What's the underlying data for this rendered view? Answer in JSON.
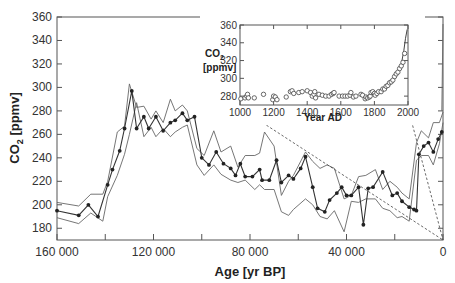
{
  "chart_data": [
    {
      "type": "line",
      "title": "",
      "xlabel": "Age [yr BP]",
      "ylabel_main": "CO",
      "ylabel_sub": "2",
      "ylabel_unit": " [ppmv]",
      "xlim": [
        160000,
        0
      ],
      "ylim": [
        170,
        360
      ],
      "x_ticks": [
        160000,
        120000,
        80000,
        40000,
        0
      ],
      "x_tick_labels": [
        "160 000",
        "120 000",
        "80 000",
        "40 000",
        "0"
      ],
      "x_minor_ticks": [
        140000,
        100000,
        60000,
        20000
      ],
      "y_ticks": [
        180,
        200,
        220,
        240,
        260,
        280,
        300,
        320,
        340,
        360
      ],
      "grid": false,
      "series": [
        {
          "name": "CO2 (ice core)",
          "style": "line with filled circle markers",
          "x": [
            160000,
            151000,
            147000,
            143000,
            139000,
            137000,
            134000,
            132000,
            129000,
            127000,
            124000,
            122000,
            119000,
            116000,
            113000,
            111000,
            108000,
            106000,
            103000,
            100000,
            97000,
            94000,
            91000,
            88000,
            86000,
            84000,
            82000,
            79000,
            76000,
            75000,
            72000,
            69000,
            67000,
            64000,
            62000,
            59000,
            57000,
            54000,
            52000,
            49000,
            47000,
            44000,
            42000,
            40000,
            38000,
            35000,
            33000,
            31000,
            29000,
            25000,
            21000,
            19000,
            17000,
            14000,
            12000,
            11000,
            10000,
            8000,
            6000,
            4000,
            2000,
            500
          ],
          "values": [
            195,
            191,
            200,
            190,
            217,
            230,
            246,
            265,
            297,
            265,
            275,
            265,
            275,
            263,
            270,
            272,
            278,
            272,
            275,
            240,
            234,
            245,
            235,
            231,
            225,
            235,
            224,
            224,
            230,
            221,
            221,
            238,
            219,
            225,
            222,
            231,
            241,
            215,
            197,
            194,
            204,
            210,
            215,
            208,
            208,
            215,
            183,
            214,
            215,
            228,
            208,
            210,
            203,
            198,
            196,
            195,
            243,
            250,
            253,
            245,
            256,
            262
          ]
        },
        {
          "name": "Upper uncertainty band",
          "style": "thin line",
          "x": [
            160000,
            151000,
            146000,
            141000,
            139000,
            135000,
            132000,
            130000,
            127000,
            124000,
            121000,
            119000,
            116000,
            113000,
            111000,
            108000,
            106000,
            102000,
            99000,
            95000,
            92000,
            88000,
            85000,
            82000,
            78000,
            76000,
            74000,
            70000,
            67000,
            64000,
            62000,
            57000,
            54000,
            51000,
            48000,
            45000,
            41000,
            38000,
            35000,
            32000,
            28000,
            25000,
            22000,
            19000,
            17000,
            14000,
            11000,
            9000,
            6000,
            4000,
            1500,
            0
          ],
          "values": [
            202,
            199,
            209,
            209,
            220,
            262,
            267,
            303,
            283,
            284,
            273,
            280,
            270,
            290,
            280,
            285,
            280,
            248,
            242,
            263,
            245,
            250,
            232,
            242,
            242,
            244,
            262,
            250,
            208,
            220,
            225,
            245,
            237,
            231,
            234,
            231,
            205,
            208,
            224,
            225,
            230,
            213,
            220,
            215,
            210,
            205,
            253,
            263,
            257,
            270,
            270,
            279
          ]
        },
        {
          "name": "Lower uncertainty band",
          "style": "thin line",
          "x": [
            160000,
            151000,
            146000,
            141000,
            139000,
            135000,
            132000,
            130000,
            127000,
            124000,
            121000,
            119000,
            116000,
            113000,
            111000,
            108000,
            106000,
            102000,
            99000,
            95000,
            92000,
            88000,
            85000,
            82000,
            78000,
            76000,
            74000,
            70000,
            67000,
            64000,
            62000,
            57000,
            54000,
            51000,
            48000,
            45000,
            41000,
            38000,
            35000,
            32000,
            28000,
            25000,
            22000,
            19000,
            17000,
            14000,
            11000,
            9000,
            6000,
            4000,
            1500,
            0
          ],
          "values": [
            189,
            184,
            193,
            186,
            207,
            225,
            243,
            260,
            287,
            258,
            266,
            258,
            265,
            258,
            262,
            266,
            268,
            234,
            225,
            234,
            226,
            221,
            219,
            221,
            213,
            217,
            213,
            213,
            194,
            191,
            196,
            205,
            200,
            190,
            188,
            195,
            177,
            203,
            202,
            205,
            205,
            197,
            195,
            189,
            190,
            186,
            238,
            242,
            242,
            234,
            252,
            270
          ]
        },
        {
          "name": "Industrial-era rise",
          "style": "thin line",
          "x": [
            500,
            0
          ],
          "values": [
            280,
            354
          ]
        }
      ],
      "annotations": [
        {
          "type": "dashed-connector",
          "from": "inset x=1000 (Year AD)",
          "to": "main x=0"
        },
        {
          "type": "dashed-connector",
          "from": "inset x=2000 (Year AD)",
          "to": "main x=0"
        }
      ]
    },
    {
      "type": "scatter",
      "title": "",
      "position": "inset upper right",
      "xlabel": "Year AD",
      "ylabel_main": "CO",
      "ylabel_sub": "2",
      "ylabel_unit": "[ppmv]",
      "xlim": [
        1000,
        2000
      ],
      "ylim": [
        270,
        360
      ],
      "x_ticks": [
        1000,
        1200,
        1400,
        1600,
        1800,
        2000
      ],
      "y_ticks": [
        280,
        300,
        320,
        340,
        360
      ],
      "grid": false,
      "series": [
        {
          "name": "Ice core CO2 (last millennium)",
          "style": "open circles",
          "x": [
            1005,
            1030,
            1040,
            1045,
            1050,
            1085,
            1140,
            1195,
            1200,
            1210,
            1220,
            1275,
            1300,
            1310,
            1320,
            1350,
            1370,
            1400,
            1420,
            1430,
            1440,
            1445,
            1450,
            1470,
            1490,
            1510,
            1530,
            1545,
            1555,
            1560,
            1590,
            1610,
            1625,
            1640,
            1655,
            1660,
            1675,
            1690,
            1720,
            1730,
            1745,
            1750,
            1760,
            1770,
            1775,
            1780,
            1790,
            1800,
            1805,
            1815,
            1825,
            1840,
            1850,
            1860,
            1870,
            1880,
            1890,
            1900,
            1910,
            1920,
            1930,
            1940,
            1950,
            1960,
            1970,
            1980
          ],
          "values": [
            277,
            278,
            280,
            282,
            278,
            278,
            282,
            276,
            280,
            279,
            276,
            279,
            285,
            286,
            283,
            284,
            285,
            286,
            284,
            280,
            282,
            285,
            278,
            282,
            281,
            280,
            280,
            282,
            283,
            284,
            280,
            280,
            280,
            280,
            281,
            284,
            279,
            280,
            282,
            281,
            277,
            279,
            278,
            279,
            280,
            284,
            285,
            283,
            281,
            283,
            285,
            285,
            288,
            288,
            291,
            292,
            295,
            296,
            298,
            302,
            305,
            307,
            311,
            314,
            318,
            328
          ]
        },
        {
          "name": "Recent record",
          "style": "line",
          "x": [
            1960,
            1975,
            1985,
            1995
          ],
          "values": [
            316,
            331,
            345,
            355
          ]
        }
      ]
    }
  ]
}
